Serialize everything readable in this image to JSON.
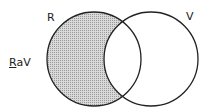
{
  "diagram": {
    "type": "venn",
    "sets": [
      {
        "label": "R",
        "shaded": "difference"
      },
      {
        "label": "V",
        "shaded": "none"
      }
    ],
    "expression": {
      "first": "R",
      "op": "a",
      "second": "V"
    },
    "colors": {
      "stroke": "#222222",
      "shade": "#b8b8b8",
      "background": "#ffffff"
    }
  }
}
